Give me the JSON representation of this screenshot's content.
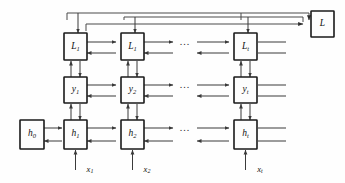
{
  "diagram": {
    "type": "computational-graph",
    "colors": {
      "background": "#fefefe",
      "box_fill": "#fdfdfd",
      "box_stroke": "#1a1a1a",
      "wire": "#3a3a3a",
      "label": "#101010"
    },
    "ellipsis": "...",
    "rows": [
      {
        "name": "loss-row",
        "nodes": [
          {
            "id": "L1a",
            "base": "L",
            "sub": "1"
          },
          {
            "id": "L1b",
            "base": "L",
            "sub": "1"
          },
          {
            "id": "Lt",
            "base": "L",
            "sub": "t"
          }
        ]
      },
      {
        "name": "output-row",
        "nodes": [
          {
            "id": "y1",
            "base": "y",
            "sub": "1"
          },
          {
            "id": "y2",
            "base": "y",
            "sub": "2"
          },
          {
            "id": "yt",
            "base": "y",
            "sub": "t"
          }
        ]
      },
      {
        "name": "hidden-row",
        "nodes": [
          {
            "id": "h1",
            "base": "h",
            "sub": "1"
          },
          {
            "id": "h2",
            "base": "h",
            "sub": "2"
          },
          {
            "id": "ht",
            "base": "h",
            "sub": "t"
          }
        ]
      }
    ],
    "initial_state": {
      "id": "h0",
      "base": "h",
      "sub": "0"
    },
    "total_loss": {
      "id": "L",
      "base": "L",
      "sub": ""
    },
    "inputs": [
      {
        "id": "x1",
        "base": "x",
        "sub": "1"
      },
      {
        "id": "x2",
        "base": "x",
        "sub": "2"
      },
      {
        "id": "xt",
        "base": "x",
        "sub": "t"
      }
    ]
  }
}
